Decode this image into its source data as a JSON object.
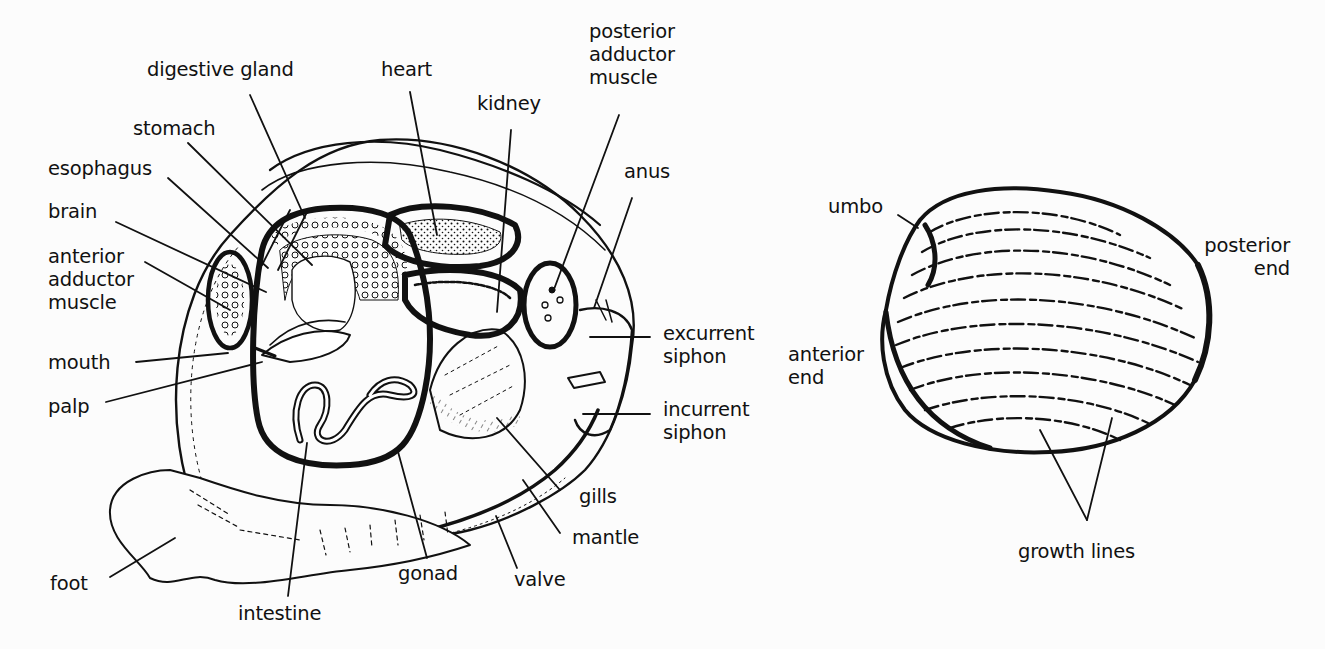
{
  "diagram": {
    "background": "#fcfcfc",
    "ink": "#111111",
    "internal_anatomy": {
      "labels": [
        {
          "id": "digestive-gland",
          "text": "digestive gland",
          "x": 147,
          "y": 58,
          "target": [
            305,
            218
          ],
          "from": [
            250,
            95
          ]
        },
        {
          "id": "heart",
          "text": "heart",
          "x": 381,
          "y": 58,
          "target": [
            437,
            235
          ],
          "from": [
            410,
            92
          ]
        },
        {
          "id": "kidney",
          "text": "kidney",
          "x": 477,
          "y": 92,
          "target": [
            497,
            310
          ],
          "from": [
            510,
            130
          ]
        },
        {
          "id": "posterior-adductor-muscle",
          "text": "posterior\nadductor\nmuscle",
          "x": 589,
          "y": 20,
          "target": [
            553,
            292
          ],
          "from": [
            619,
            115
          ]
        },
        {
          "id": "anus",
          "text": "anus",
          "x": 624,
          "y": 160,
          "target": [
            594,
            308
          ],
          "from": [
            632,
            198
          ]
        },
        {
          "id": "stomach",
          "text": "stomach",
          "x": 133,
          "y": 117,
          "target": [
            312,
            265
          ],
          "from": [
            188,
            143
          ]
        },
        {
          "id": "esophagus",
          "text": "esophagus",
          "x": 48,
          "y": 157,
          "target": [
            268,
            268
          ],
          "from": [
            168,
            178
          ]
        },
        {
          "id": "brain",
          "text": "brain",
          "x": 48,
          "y": 200,
          "target": [
            266,
            292
          ],
          "from": [
            116,
            222
          ]
        },
        {
          "id": "anterior-adductor-muscle",
          "text": "anterior\nadductor\nmuscle",
          "x": 48,
          "y": 245,
          "target": [
            230,
            310
          ],
          "from": [
            145,
            262
          ]
        },
        {
          "id": "mouth",
          "text": "mouth",
          "x": 48,
          "y": 351,
          "target": [
            228,
            353
          ],
          "from": [
            136,
            362
          ]
        },
        {
          "id": "palp",
          "text": "palp",
          "x": 48,
          "y": 395,
          "target": [
            262,
            362
          ],
          "from": [
            106,
            402
          ]
        },
        {
          "id": "foot",
          "text": "foot",
          "x": 50,
          "y": 572,
          "target": [
            175,
            538
          ],
          "from": [
            110,
            577
          ]
        },
        {
          "id": "intestine",
          "text": "intestine",
          "x": 238,
          "y": 602,
          "target": [
            307,
            443
          ],
          "from": [
            288,
            596
          ]
        },
        {
          "id": "gonad",
          "text": "gonad",
          "x": 398,
          "y": 562,
          "target": [
            397,
            448
          ],
          "from": [
            427,
            558
          ]
        },
        {
          "id": "valve",
          "text": "valve",
          "x": 514,
          "y": 568,
          "target": [
            496,
            516
          ],
          "from": [
            517,
            568
          ]
        },
        {
          "id": "mantle",
          "text": "mantle",
          "x": 572,
          "y": 526,
          "target": [
            523,
            480
          ],
          "from": [
            560,
            533
          ]
        },
        {
          "id": "gills",
          "text": "gills",
          "x": 579,
          "y": 485,
          "target": [
            497,
            418
          ],
          "from": [
            560,
            490
          ]
        },
        {
          "id": "excurrent-siphon",
          "text": "excurrent\nsiphon",
          "x": 663,
          "y": 322,
          "target": [
            590,
            337
          ],
          "from": [
            650,
            337
          ]
        },
        {
          "id": "incurrent-siphon",
          "text": "incurrent\nsiphon",
          "x": 663,
          "y": 398,
          "target": [
            583,
            414
          ],
          "from": [
            650,
            414
          ]
        }
      ]
    },
    "external_shell": {
      "labels": [
        {
          "id": "umbo",
          "text": "umbo",
          "x": 828,
          "y": 195,
          "align": "left",
          "target": [
            918,
            228
          ],
          "from": [
            898,
            215
          ]
        },
        {
          "id": "posterior-end",
          "text": "posterior\nend",
          "x": 1185,
          "y": 234,
          "align": "right",
          "width": 105
        },
        {
          "id": "anterior-end",
          "text": "anterior\nend",
          "x": 788,
          "y": 343,
          "align": "left"
        },
        {
          "id": "growth-lines",
          "text": "growth lines",
          "x": 1018,
          "y": 540,
          "align": "left",
          "target": [
            1040,
            430
          ],
          "target2": [
            1112,
            418
          ],
          "apex": [
            1087,
            520
          ]
        }
      ]
    }
  }
}
